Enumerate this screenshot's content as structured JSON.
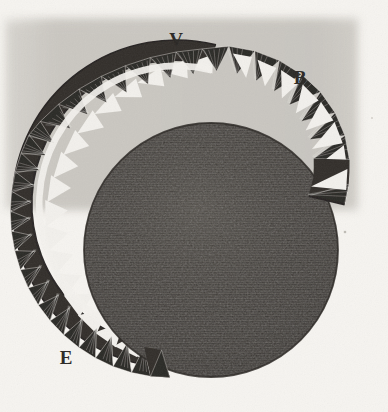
{
  "figure": {
    "medium": "engraving on aged paper",
    "width": 388,
    "height": 412
  },
  "colors": {
    "paper_light": "#fbfaf7",
    "paper_shadow": "#c9c6c0",
    "paper_shadow_edge": "#d8d5cf",
    "ink_dark": "#2a2724",
    "ink_mid": "#4a4641",
    "disc_fill": "#4f4b46",
    "disc_dark": "#3a3733",
    "gap_white": "#f4f2ee",
    "label_color": "#2a2724"
  },
  "labels": [
    {
      "id": "label-v",
      "text": "V",
      "x": 176,
      "y": 46,
      "size": 19
    },
    {
      "id": "label-b",
      "text": "B",
      "x": 300,
      "y": 84,
      "size": 19
    },
    {
      "id": "label-e",
      "text": "E",
      "x": 66,
      "y": 364,
      "size": 19
    }
  ],
  "scan_shadow": {
    "x": 4,
    "y": 18,
    "width": 354,
    "height": 192
  },
  "disc": {
    "center_x": 211,
    "center_y": 250,
    "radius": 127
  },
  "ring": {
    "center_x": 182,
    "center_y": 205,
    "outer_radius": 164,
    "inner_radius": 140,
    "start_angle_deg": -78,
    "end_angle_deg": 200,
    "tooth_count": 30,
    "tooth_depth": 20,
    "description": "dark band with inward-pointing hatched triangular teeth"
  },
  "annotations": {
    "v_meaning": "upper apex of toothed ring",
    "b_meaning": "outer right edge of toothed ring",
    "e_meaning": "lower left terminus of toothed ring"
  }
}
